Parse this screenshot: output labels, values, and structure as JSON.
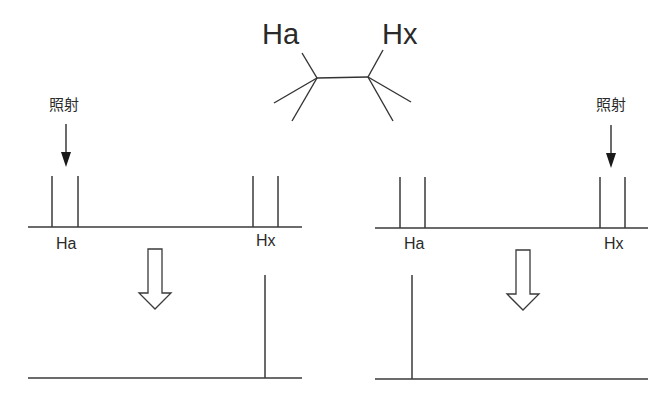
{
  "molecule": {
    "left_proton": "Ha",
    "right_proton": "Hx"
  },
  "panels": {
    "left": {
      "irradiation_label": "照射",
      "irradiated_signal": "Ha",
      "before": {
        "labels": [
          "Ha",
          "Hx"
        ],
        "peaks": {
          "Ha": "doublet",
          "Hx": "doublet"
        }
      },
      "after": {
        "remaining": "Hx",
        "pattern": "singlet"
      }
    },
    "right": {
      "irradiation_label": "照射",
      "irradiated_signal": "Hx",
      "before": {
        "labels": [
          "Ha",
          "Hx"
        ],
        "peaks": {
          "Ha": "doublet",
          "Hx": "doublet"
        }
      },
      "after": {
        "remaining": "Ha",
        "pattern": "singlet"
      }
    }
  },
  "colors": {
    "line": "#3a3a3a",
    "text": "#2a2a2a",
    "background": "#ffffff"
  }
}
